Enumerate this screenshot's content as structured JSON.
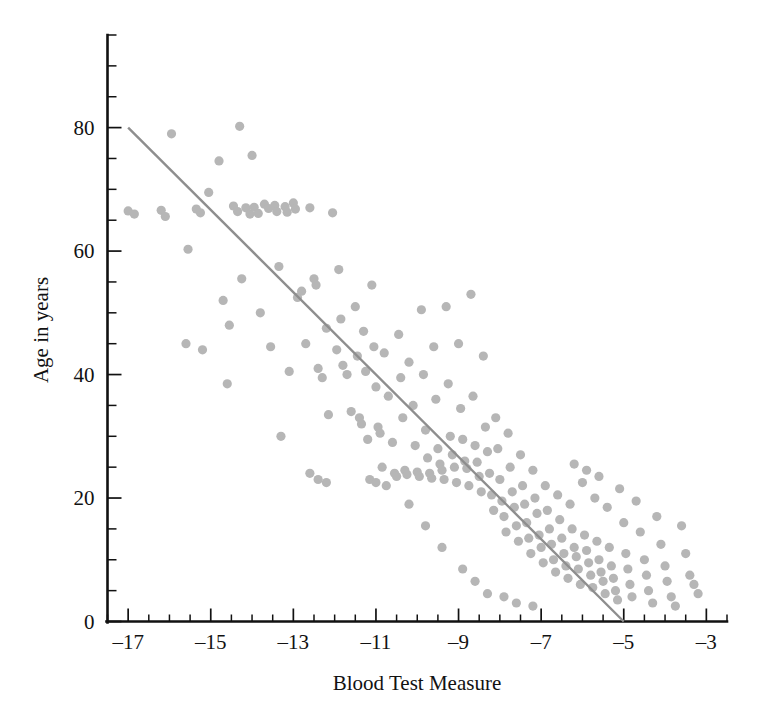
{
  "chart_data": {
    "type": "scatter",
    "title": "",
    "xlabel": "Blood Test Measure",
    "ylabel": "Age in years",
    "xlim": [
      -17.5,
      -2.5
    ],
    "ylim": [
      0,
      95
    ],
    "grid": false,
    "legend": "none",
    "point_color": "#b6b6b6",
    "point_radius_px": 4.6,
    "line_color": "#8e8e8e",
    "x_major_ticks": [
      -17,
      -15,
      -13,
      -11,
      -9,
      -7,
      -5,
      -3
    ],
    "x_tick_labels": [
      "–17",
      "–15",
      "–13",
      "–11",
      "–9",
      "–7",
      "–5",
      "–3"
    ],
    "x_minor_step": 0.5,
    "y_major_ticks": [
      0,
      20,
      40,
      60,
      80
    ],
    "y_tick_labels": [
      "0",
      "20",
      "40",
      "60",
      "80"
    ],
    "y_minor_step": 5,
    "y_axis_top": 95,
    "trend_line": {
      "label": "regression line",
      "x0": -17,
      "y0": 80,
      "x1": -5,
      "y1": 0
    },
    "points": [
      [
        -17.0,
        66.5
      ],
      [
        -16.85,
        66.0
      ],
      [
        -16.2,
        66.6
      ],
      [
        -16.1,
        65.6
      ],
      [
        -15.95,
        79.0
      ],
      [
        -15.55,
        60.3
      ],
      [
        -15.35,
        66.8
      ],
      [
        -15.25,
        66.2
      ],
      [
        -15.2,
        44.0
      ],
      [
        -15.05,
        69.5
      ],
      [
        -14.8,
        74.6
      ],
      [
        -14.7,
        52.0
      ],
      [
        -14.55,
        48.0
      ],
      [
        -14.45,
        67.3
      ],
      [
        -14.35,
        66.4
      ],
      [
        -14.3,
        80.2
      ],
      [
        -14.25,
        55.5
      ],
      [
        -14.15,
        67.0
      ],
      [
        -14.05,
        66.0
      ],
      [
        -14.0,
        75.5
      ],
      [
        -13.95,
        67.1
      ],
      [
        -13.85,
        66.1
      ],
      [
        -13.8,
        50.0
      ],
      [
        -13.7,
        67.6
      ],
      [
        -13.6,
        66.9
      ],
      [
        -13.55,
        44.5
      ],
      [
        -13.45,
        67.4
      ],
      [
        -13.4,
        66.4
      ],
      [
        -13.35,
        57.5
      ],
      [
        -13.2,
        67.2
      ],
      [
        -13.15,
        66.3
      ],
      [
        -13.1,
        40.5
      ],
      [
        -13.0,
        67.8
      ],
      [
        -12.95,
        66.8
      ],
      [
        -12.9,
        52.5
      ],
      [
        -12.8,
        53.5
      ],
      [
        -12.7,
        45.0
      ],
      [
        -12.6,
        67.0
      ],
      [
        -12.5,
        55.5
      ],
      [
        -12.45,
        54.5
      ],
      [
        -12.4,
        41.0
      ],
      [
        -12.3,
        39.5
      ],
      [
        -12.2,
        47.5
      ],
      [
        -12.15,
        33.5
      ],
      [
        -12.05,
        66.2
      ],
      [
        -11.95,
        44.0
      ],
      [
        -11.9,
        57.0
      ],
      [
        -11.85,
        49.0
      ],
      [
        -11.8,
        41.5
      ],
      [
        -11.7,
        40.0
      ],
      [
        -11.6,
        34.0
      ],
      [
        -11.5,
        51.0
      ],
      [
        -11.45,
        43.0
      ],
      [
        -11.4,
        33.0
      ],
      [
        -11.35,
        32.0
      ],
      [
        -11.3,
        47.0
      ],
      [
        -11.25,
        40.5
      ],
      [
        -11.2,
        29.5
      ],
      [
        -11.1,
        54.5
      ],
      [
        -11.05,
        44.5
      ],
      [
        -11.0,
        38.0
      ],
      [
        -10.95,
        31.5
      ],
      [
        -10.9,
        30.5
      ],
      [
        -10.85,
        25.0
      ],
      [
        -10.8,
        43.5
      ],
      [
        -10.7,
        36.5
      ],
      [
        -10.6,
        29.0
      ],
      [
        -10.55,
        24.0
      ],
      [
        -10.5,
        23.5
      ],
      [
        -10.45,
        46.5
      ],
      [
        -10.4,
        39.5
      ],
      [
        -10.35,
        33.0
      ],
      [
        -10.3,
        24.5
      ],
      [
        -10.25,
        23.8
      ],
      [
        -10.2,
        42.0
      ],
      [
        -10.1,
        35.0
      ],
      [
        -10.05,
        28.5
      ],
      [
        -10.0,
        24.2
      ],
      [
        -9.95,
        23.5
      ],
      [
        -9.9,
        50.5
      ],
      [
        -9.85,
        40.0
      ],
      [
        -9.8,
        31.0
      ],
      [
        -9.75,
        26.5
      ],
      [
        -9.7,
        24.0
      ],
      [
        -9.65,
        23.2
      ],
      [
        -9.6,
        44.5
      ],
      [
        -9.55,
        36.0
      ],
      [
        -9.5,
        28.0
      ],
      [
        -9.45,
        25.5
      ],
      [
        -9.4,
        24.5
      ],
      [
        -9.35,
        23.0
      ],
      [
        -9.3,
        51.0
      ],
      [
        -9.25,
        38.5
      ],
      [
        -9.2,
        30.0
      ],
      [
        -9.15,
        27.0
      ],
      [
        -9.1,
        25.0
      ],
      [
        -9.05,
        22.5
      ],
      [
        -9.0,
        45.0
      ],
      [
        -8.95,
        34.5
      ],
      [
        -8.9,
        29.5
      ],
      [
        -8.85,
        26.0
      ],
      [
        -8.8,
        24.8
      ],
      [
        -8.75,
        22.0
      ],
      [
        -8.7,
        53.0
      ],
      [
        -8.65,
        36.5
      ],
      [
        -8.6,
        28.5
      ],
      [
        -8.55,
        25.8
      ],
      [
        -8.5,
        23.5
      ],
      [
        -8.45,
        21.0
      ],
      [
        -8.4,
        43.0
      ],
      [
        -8.35,
        31.5
      ],
      [
        -8.3,
        27.5
      ],
      [
        -8.25,
        24.0
      ],
      [
        -8.2,
        20.5
      ],
      [
        -8.15,
        18.0
      ],
      [
        -8.1,
        33.0
      ],
      [
        -8.05,
        28.0
      ],
      [
        -8.0,
        23.0
      ],
      [
        -7.95,
        19.5
      ],
      [
        -7.9,
        17.0
      ],
      [
        -7.85,
        14.5
      ],
      [
        -7.8,
        30.5
      ],
      [
        -7.75,
        25.0
      ],
      [
        -7.7,
        21.0
      ],
      [
        -7.65,
        18.5
      ],
      [
        -7.6,
        15.5
      ],
      [
        -7.55,
        13.0
      ],
      [
        -7.5,
        27.0
      ],
      [
        -7.45,
        22.0
      ],
      [
        -7.4,
        19.0
      ],
      [
        -7.35,
        16.0
      ],
      [
        -7.3,
        13.5
      ],
      [
        -7.25,
        11.0
      ],
      [
        -7.2,
        24.5
      ],
      [
        -7.15,
        20.0
      ],
      [
        -7.1,
        17.5
      ],
      [
        -7.05,
        14.0
      ],
      [
        -7.0,
        12.0
      ],
      [
        -6.95,
        9.5
      ],
      [
        -6.9,
        22.0
      ],
      [
        -6.85,
        18.0
      ],
      [
        -6.8,
        15.0
      ],
      [
        -6.75,
        12.5
      ],
      [
        -6.7,
        10.0
      ],
      [
        -6.65,
        8.0
      ],
      [
        -6.6,
        20.5
      ],
      [
        -6.55,
        16.5
      ],
      [
        -6.5,
        13.5
      ],
      [
        -6.45,
        11.0
      ],
      [
        -6.4,
        9.0
      ],
      [
        -6.35,
        7.0
      ],
      [
        -6.3,
        19.0
      ],
      [
        -6.25,
        15.0
      ],
      [
        -6.2,
        12.0
      ],
      [
        -6.15,
        10.5
      ],
      [
        -6.1,
        8.5
      ],
      [
        -6.05,
        6.0
      ],
      [
        -6.0,
        22.5
      ],
      [
        -5.95,
        14.0
      ],
      [
        -5.9,
        11.5
      ],
      [
        -5.85,
        9.5
      ],
      [
        -5.8,
        7.5
      ],
      [
        -5.75,
        5.5
      ],
      [
        -5.7,
        20.0
      ],
      [
        -5.65,
        13.0
      ],
      [
        -5.6,
        10.0
      ],
      [
        -5.55,
        8.0
      ],
      [
        -5.5,
        6.5
      ],
      [
        -5.45,
        4.5
      ],
      [
        -5.4,
        18.5
      ],
      [
        -5.35,
        12.0
      ],
      [
        -5.3,
        9.0
      ],
      [
        -5.25,
        7.0
      ],
      [
        -5.2,
        5.0
      ],
      [
        -5.15,
        3.5
      ],
      [
        -5.1,
        21.5
      ],
      [
        -5.0,
        16.0
      ],
      [
        -4.95,
        11.0
      ],
      [
        -4.9,
        8.5
      ],
      [
        -4.85,
        6.0
      ],
      [
        -4.8,
        4.0
      ],
      [
        -4.7,
        19.5
      ],
      [
        -4.6,
        14.5
      ],
      [
        -4.5,
        10.0
      ],
      [
        -4.45,
        7.5
      ],
      [
        -4.4,
        5.0
      ],
      [
        -4.3,
        3.0
      ],
      [
        -4.2,
        17.0
      ],
      [
        -4.1,
        12.5
      ],
      [
        -4.0,
        9.0
      ],
      [
        -3.95,
        6.5
      ],
      [
        -3.85,
        4.0
      ],
      [
        -3.75,
        2.5
      ],
      [
        -3.6,
        15.5
      ],
      [
        -3.5,
        11.0
      ],
      [
        -3.4,
        7.5
      ],
      [
        -3.3,
        6.0
      ],
      [
        -3.2,
        4.5
      ],
      [
        -7.9,
        4.0
      ],
      [
        -7.6,
        3.0
      ],
      [
        -7.2,
        2.5
      ],
      [
        -8.6,
        6.5
      ],
      [
        -8.3,
        4.5
      ],
      [
        -8.9,
        8.5
      ],
      [
        -9.4,
        12.0
      ],
      [
        -9.8,
        15.5
      ],
      [
        -10.2,
        19.0
      ],
      [
        -12.6,
        24.0
      ],
      [
        -12.4,
        23.0
      ],
      [
        -12.2,
        22.5
      ],
      [
        -11.15,
        23.0
      ],
      [
        -11.0,
        22.5
      ],
      [
        -10.75,
        22.0
      ],
      [
        -6.2,
        25.5
      ],
      [
        -5.9,
        24.5
      ],
      [
        -5.6,
        23.5
      ],
      [
        -13.3,
        30.0
      ],
      [
        -14.6,
        38.5
      ],
      [
        -15.6,
        45.0
      ]
    ]
  }
}
